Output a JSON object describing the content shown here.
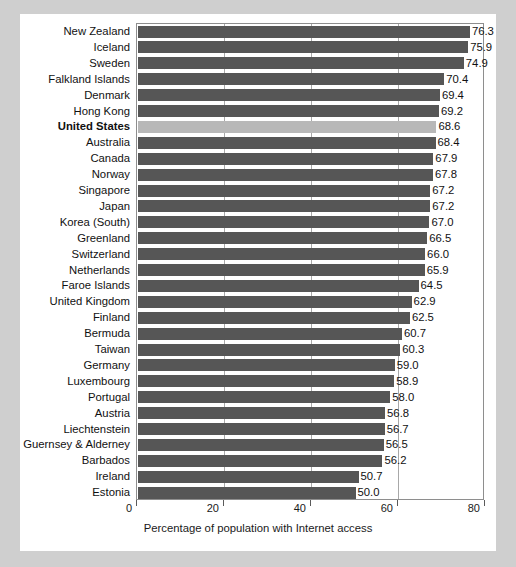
{
  "chart_data": {
    "type": "bar",
    "orientation": "horizontal",
    "title": "",
    "xlabel": "Percentage of population with Internet access",
    "ylabel": "",
    "xlim": [
      0,
      80
    ],
    "xticks": [
      0,
      20,
      40,
      60,
      80
    ],
    "xtick_labels": [
      "0",
      "20",
      "40",
      "60",
      "80"
    ],
    "grid": true,
    "legend": false,
    "highlight_category": "United States",
    "colors": {
      "bar": "#565656",
      "bar_highlight": "#b8b8b8",
      "background": "#ffffff",
      "page_background": "#cfcfcf",
      "frame": "#8e8e8e",
      "gridline": "#a8a8a8",
      "text": "#111111"
    },
    "categories": [
      "New Zealand",
      "Iceland",
      "Sweden",
      "Falkland Islands",
      "Denmark",
      "Hong Kong",
      "United States",
      "Australia",
      "Canada",
      "Norway",
      "Singapore",
      "Japan",
      "Korea (South)",
      "Greenland",
      "Switzerland",
      "Netherlands",
      "Faroe Islands",
      "United Kingdom",
      "Finland",
      "Bermuda",
      "Taiwan",
      "Germany",
      "Luxembourg",
      "Portugal",
      "Austria",
      "Liechtenstein",
      "Guernsey & Alderney",
      "Barbados",
      "Ireland",
      "Estonia"
    ],
    "values": [
      76.3,
      75.9,
      74.9,
      70.4,
      69.4,
      69.2,
      68.6,
      68.4,
      67.9,
      67.8,
      67.2,
      67.2,
      67.0,
      66.5,
      66.0,
      65.9,
      64.5,
      62.9,
      62.5,
      60.7,
      60.3,
      59.0,
      58.9,
      58.0,
      56.8,
      56.7,
      56.5,
      56.2,
      50.7,
      50.0
    ],
    "value_labels": [
      "76.3",
      "75.9",
      "74.9",
      "70.4",
      "69.4",
      "69.2",
      "68.6",
      "68.4",
      "67.9",
      "67.8",
      "67.2",
      "67.2",
      "67.0",
      "66.5",
      "66.0",
      "65.9",
      "64.5",
      "62.9",
      "62.5",
      "60.7",
      "60.3",
      "59.0",
      "58.9",
      "58.0",
      "56.8",
      "56.7",
      "56.5",
      "56.2",
      "50.7",
      "50.0"
    ]
  }
}
